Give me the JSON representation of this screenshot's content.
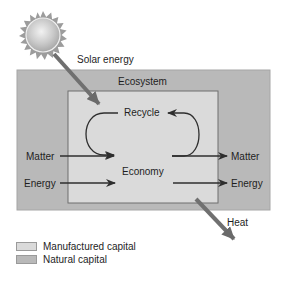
{
  "diagram": {
    "labels": {
      "solar_energy": "Solar energy",
      "ecosystem": "Ecosystem",
      "recycle": "Recycle",
      "economy": "Economy",
      "matter_in": "Matter",
      "energy_in": "Energy",
      "matter_out": "Matter",
      "energy_out": "Energy",
      "heat": "Heat"
    },
    "icons": {
      "sun": "sun-icon"
    },
    "colors": {
      "natural_capital": "#b9b9b9",
      "manufactured_capital": "#dadada",
      "arrow": "#3a3a3a",
      "wide_arrow": "#6e6e6e",
      "sun_body": "#c8c8c8",
      "sun_rays": "#9a9a9a"
    }
  },
  "legend": {
    "items": [
      {
        "label": "Manufactured capital",
        "color": "#dadada"
      },
      {
        "label": "Natural capital",
        "color": "#b9b9b9"
      }
    ]
  }
}
